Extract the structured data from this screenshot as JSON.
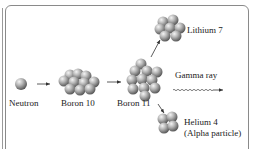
{
  "diagram": {
    "nodes": {
      "neutron": {
        "label": "Neutron"
      },
      "boron10": {
        "label": "Boron 10"
      },
      "boron11": {
        "label": "Boron 11"
      },
      "lithium7": {
        "label": "Lithium 7"
      },
      "gamma": {
        "label": "Gamma ray"
      },
      "helium4": {
        "label": "Helium 4",
        "sublabel": "(Alpha particle)"
      }
    },
    "edges": [
      {
        "from": "neutron",
        "to": "boron10"
      },
      {
        "from": "boron10",
        "to": "boron11"
      },
      {
        "from": "boron11",
        "to": "lithium7"
      },
      {
        "from": "boron11",
        "to": "gamma"
      },
      {
        "from": "boron11",
        "to": "helium4"
      }
    ],
    "colors": {
      "sphere": "#8c8c8c",
      "sphere_highlight": "#f2f2f2",
      "line": "#333333",
      "frame": "#8a8a8a"
    }
  }
}
